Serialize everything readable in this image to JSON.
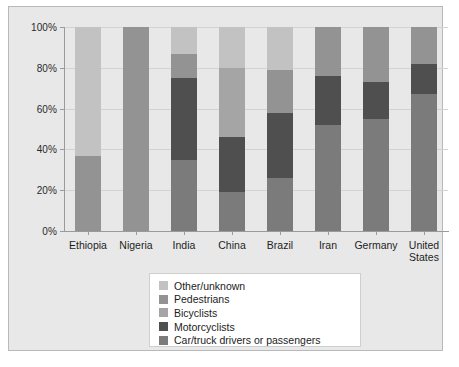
{
  "chart_data": {
    "type": "bar",
    "subtype": "stacked-100-percent",
    "title": "",
    "xlabel": "",
    "ylabel": "",
    "ylim": [
      0,
      100
    ],
    "ytick_labels": [
      "0%",
      "20%",
      "40%",
      "60%",
      "80%",
      "100%"
    ],
    "ytick_values": [
      0,
      20,
      40,
      60,
      80,
      100
    ],
    "grid": true,
    "legend_position": "bottom-center",
    "categories": [
      "Ethiopia",
      "Nigeria",
      "India",
      "China",
      "Brazil",
      "Iran",
      "Germany",
      "United States"
    ],
    "series": [
      {
        "name": "Car/truck drivers or passengers",
        "color": "#7b7b7b",
        "values": [
          0,
          0,
          35,
          19,
          26,
          52,
          55,
          67
        ]
      },
      {
        "name": "Motorcyclists",
        "color": "#4f4f4f",
        "values": [
          0,
          0,
          40,
          27,
          32,
          24,
          18,
          15
        ]
      },
      {
        "name": "Bicyclists",
        "color": "#a5a5a5",
        "values": [
          0,
          0,
          0,
          34,
          0,
          0,
          0,
          0
        ]
      },
      {
        "name": "Pedestrians",
        "color": "#939393",
        "values": [
          37,
          100,
          12,
          0,
          21,
          24,
          27,
          18
        ]
      },
      {
        "name": "Other/unknown",
        "color": "#c2c2c2",
        "values": [
          63,
          0,
          13,
          20,
          21,
          0,
          0,
          0
        ]
      }
    ]
  },
  "legend": {
    "items": [
      {
        "label": "Other/unknown",
        "color": "#c2c2c2"
      },
      {
        "label": "Pedestrians",
        "color": "#939393"
      },
      {
        "label": "Bicyclists",
        "color": "#a5a5a5"
      },
      {
        "label": "Motorcyclists",
        "color": "#4f4f4f"
      },
      {
        "label": "Car/truck drivers or passengers",
        "color": "#7b7b7b"
      }
    ]
  }
}
